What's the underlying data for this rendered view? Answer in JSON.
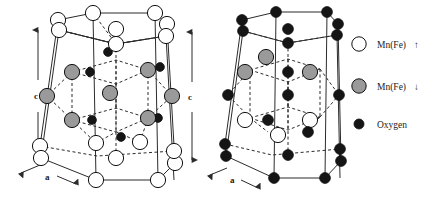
{
  "figure": {
    "background_color": "#ffffff"
  },
  "colors": {
    "line": "#2b2b2b",
    "atom_white_fill": "#ffffff",
    "atom_gray_fill": "#9a9a9a",
    "atom_black_fill": "#151515",
    "outline": "#111111",
    "text": "#1a1a1a"
  },
  "cells": [
    {
      "id": "left-cell",
      "name": "hexagonal-unit-cell-left",
      "axis_c_label": "c",
      "axis_a_label": "a",
      "corner_atom_species": "Mn(Fe)-up",
      "interior_atom_species": "Mn(Fe)-down",
      "oxygen_count": 8
    },
    {
      "id": "right-cell",
      "name": "hexagonal-unit-cell-right",
      "axis_c_label": "c",
      "axis_a_label": "a",
      "corner_atom_species": "Oxygen",
      "interior_upper_species": "Mn(Fe)-down",
      "interior_lower_species": "Mn(Fe)-up"
    }
  ],
  "legend": {
    "name": "atom-species-legend",
    "items": [
      {
        "marker": "open-circle",
        "label": "Mn(Fe)",
        "spin": "↑",
        "spin_name": "up-arrow-icon"
      },
      {
        "marker": "gray-circle",
        "label": "Mn(Fe)",
        "spin": "↓",
        "spin_name": "down-arrow-icon"
      },
      {
        "marker": "filled-dot",
        "label": "Oxygen",
        "spin": "",
        "spin_name": "none"
      }
    ]
  }
}
